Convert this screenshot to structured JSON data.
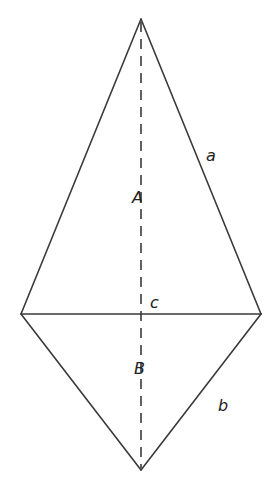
{
  "diagram": {
    "title": "",
    "vertices": {
      "top": {
        "x": 141,
        "y": 19
      },
      "left": {
        "x": 21,
        "y": 314
      },
      "right": {
        "x": 261,
        "y": 314
      },
      "bottom": {
        "x": 141,
        "y": 470
      }
    },
    "labels": {
      "side_a": {
        "text": "a",
        "x": 208,
        "y": 160
      },
      "region_A": {
        "text": "A",
        "x": 133,
        "y": 203
      },
      "base_c": {
        "text": "c",
        "x": 150,
        "y": 308
      },
      "region_B": {
        "text": "B",
        "x": 135,
        "y": 374
      },
      "side_b": {
        "text": "b",
        "x": 218,
        "y": 411
      }
    },
    "colors": {
      "stroke": "#3a3a3a",
      "text": "#222222",
      "background": "#ffffff"
    }
  }
}
